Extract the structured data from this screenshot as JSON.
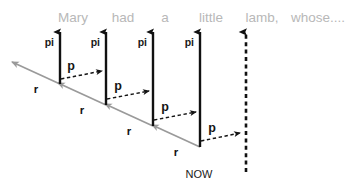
{
  "diagram": {
    "title_sentence": {
      "words": [
        {
          "text": "Mary",
          "x": 73,
          "y": 22
        },
        {
          "text": "had",
          "x": 123,
          "y": 22
        },
        {
          "text": "a",
          "x": 165,
          "y": 22
        },
        {
          "text": "little",
          "x": 211,
          "y": 22
        },
        {
          "text": "lamb,",
          "x": 262,
          "y": 22
        },
        {
          "text": "whose....",
          "x": 318,
          "y": 22
        }
      ]
    },
    "now_label": {
      "text": "NOW",
      "x": 199,
      "y": 178
    },
    "timesteps": [
      {
        "id": "step-1",
        "pi_label": "pi",
        "pi_label_x": 54,
        "pi_label_y": 46,
        "axis_x": 60,
        "axis_top_y": 32,
        "axis_bottom_y": 84,
        "axis_style": "solid",
        "p_label": "p",
        "p_label_x": 71,
        "p_label_y": 70,
        "p_from_x": 61,
        "p_from_y": 79,
        "p_to_x": 102,
        "p_to_y": 71,
        "r_label": "r",
        "r_label_x": 36,
        "r_label_y": 93,
        "r_from_x": 60,
        "r_from_y": 84,
        "r_to_x": 12,
        "r_to_y": 62
      },
      {
        "id": "step-2",
        "pi_label": "pi",
        "pi_label_x": 100,
        "pi_label_y": 46,
        "axis_x": 106,
        "axis_top_y": 32,
        "axis_bottom_y": 105,
        "axis_style": "solid",
        "p_label": "p",
        "p_label_x": 118,
        "p_label_y": 90,
        "p_from_x": 107,
        "p_from_y": 99,
        "p_to_x": 149,
        "p_to_y": 91,
        "r_label": "r",
        "r_label_x": 82,
        "r_label_y": 114,
        "r_from_x": 106,
        "r_from_y": 105,
        "r_to_x": 58,
        "r_to_y": 83
      },
      {
        "id": "step-3",
        "pi_label": "pi",
        "pi_label_x": 147,
        "pi_label_y": 46,
        "axis_x": 153,
        "axis_top_y": 32,
        "axis_bottom_y": 126,
        "axis_style": "solid",
        "p_label": "p",
        "p_label_x": 165,
        "p_label_y": 111,
        "p_from_x": 154,
        "p_from_y": 120,
        "p_to_x": 196,
        "p_to_y": 112,
        "r_label": "r",
        "r_label_x": 129,
        "r_label_y": 135,
        "r_from_x": 153,
        "r_from_y": 126,
        "r_to_x": 105,
        "r_to_y": 104
      },
      {
        "id": "step-4",
        "pi_label": "pi",
        "pi_label_x": 194,
        "pi_label_y": 46,
        "axis_x": 200,
        "axis_top_y": 32,
        "axis_bottom_y": 147,
        "axis_style": "solid",
        "p_label": "p",
        "p_label_x": 212,
        "p_label_y": 132,
        "p_from_x": 201,
        "p_from_y": 141,
        "p_to_x": 240,
        "p_to_y": 133,
        "r_label": "r",
        "r_label_x": 176,
        "r_label_y": 156,
        "r_from_x": 200,
        "r_from_y": 147,
        "r_to_x": 152,
        "r_to_y": 125
      },
      {
        "id": "step-5-now",
        "pi_label": "",
        "pi_label_x": 0,
        "pi_label_y": 0,
        "axis_x": 246,
        "axis_top_y": 32,
        "axis_bottom_y": 172,
        "axis_style": "dashed",
        "p_label": "",
        "p_label_x": 0,
        "p_label_y": 0,
        "p_from_x": 0,
        "p_from_y": 0,
        "p_to_x": 0,
        "p_to_y": 0,
        "r_label": "",
        "r_label_x": 0,
        "r_label_y": 0,
        "r_from_x": 0,
        "r_from_y": 0,
        "r_to_x": 0,
        "r_to_y": 0
      }
    ],
    "colors": {
      "sentence_text": "#b8b8b8",
      "axis_stroke": "#111111",
      "p_arrow_stroke": "#141414",
      "r_arrow_stroke": "#9a9a9a",
      "background": "#ffffff"
    }
  }
}
